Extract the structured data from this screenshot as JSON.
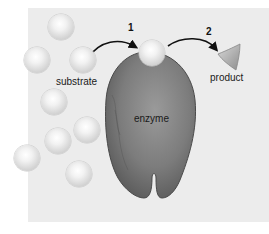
{
  "diagram": {
    "title": "",
    "labels": {
      "substrate": "substrate",
      "enzyme": "enzyme",
      "product": "product"
    },
    "steps": [
      {
        "number": "1",
        "description": "substrate binds enzyme"
      },
      {
        "number": "2",
        "description": "product released"
      }
    ],
    "colors": {
      "background_panel": "#ececec",
      "enzyme": "#7a7a7a",
      "substrate": "#e6e6e6",
      "product": "#b8b8b8",
      "arrow": "#111111"
    },
    "substrate_count": 9
  }
}
